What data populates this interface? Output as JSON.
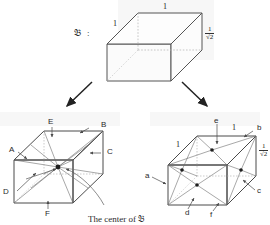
{
  "figure": {
    "label": "𝔅",
    "label_colon": ":",
    "caption": "The center of 𝔅",
    "box_dims": {
      "length_top": "1",
      "length_side": "1",
      "height_num": "1",
      "height_den": "√2"
    }
  },
  "top_box": {
    "name": "reference-box",
    "edge_top_label": "1",
    "edge_left_label": "1",
    "height_label_num": "1",
    "height_label_den": "√2"
  },
  "arrows": [
    {
      "name": "arrow-to-left-diagram",
      "direction": "down-left"
    },
    {
      "name": "arrow-to-right-diagram",
      "direction": "down-right"
    }
  ],
  "left_diagram": {
    "name": "center-point-diagram",
    "face_labels": [
      "A",
      "B",
      "C",
      "D",
      "E",
      "F"
    ],
    "center_dot": "center"
  },
  "right_diagram": {
    "name": "face-pyramid-diagram",
    "face_labels": [
      "a",
      "b",
      "c",
      "d",
      "e",
      "f"
    ],
    "edge_top_label": "1",
    "edge_left_label": "1",
    "height_label_num": "1",
    "height_label_den": "√2"
  },
  "colors": {
    "ink": "#2a2a2a",
    "edge": "#4a4a4a",
    "hidden_edge": "#8d8d8d",
    "paper": "#ffffff",
    "smudge": "#f1f1f1"
  }
}
